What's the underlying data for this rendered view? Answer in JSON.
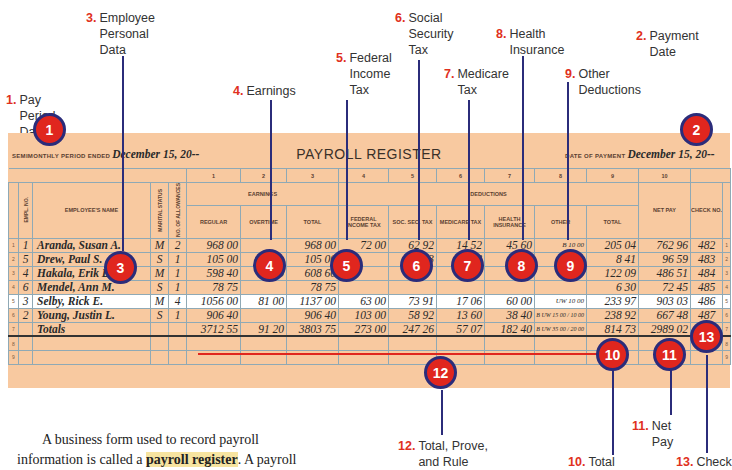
{
  "callouts": [
    {
      "num": "1.",
      "label": "Pay Period Date"
    },
    {
      "num": "2.",
      "label": "Payment Date"
    },
    {
      "num": "3.",
      "label": "Employee Personal Data"
    },
    {
      "num": "4.",
      "label": "Earnings"
    },
    {
      "num": "5.",
      "label": "Federal Income Tax"
    },
    {
      "num": "6.",
      "label": "Social Security Tax"
    },
    {
      "num": "7.",
      "label": "Medicare Tax"
    },
    {
      "num": "8.",
      "label": "Health Insurance"
    },
    {
      "num": "9.",
      "label": "Other Deductions"
    },
    {
      "num": "10.",
      "label": "Total"
    },
    {
      "num": "11.",
      "label": "Net Pay"
    },
    {
      "num": "12.",
      "label": "Total, Prove, and Rule"
    },
    {
      "num": "13.",
      "label": "Check"
    }
  ],
  "badges": [
    "1",
    "2",
    "3",
    "4",
    "5",
    "6",
    "7",
    "8",
    "9",
    "10",
    "11",
    "12",
    "13"
  ],
  "form": {
    "title": "PAYROLL REGISTER",
    "period_label": "SEMIMONTHLY PERIOD ENDED",
    "period_date": "December 15, 20--",
    "payment_label": "DATE OF PAYMENT",
    "payment_date": "December 15, 20--",
    "column_numbers": [
      "1",
      "2",
      "3",
      "4",
      "5",
      "6",
      "7",
      "8",
      "9",
      "10"
    ],
    "group_headers": {
      "earnings": "EARNINGS",
      "deductions": "DEDUCTIONS"
    },
    "headers": {
      "empl_no": "EMPL. NO.",
      "name": "EMPLOYEE'S NAME",
      "marital": "MARITAL STATUS",
      "allowances": "NO. OF ALLOWANCES",
      "regular": "REGULAR",
      "overtime": "OVERTIME",
      "total_earn": "TOTAL",
      "fit": "FEDERAL INCOME TAX",
      "ss": "SOC. SEC. TAX",
      "medicare": "MEDICARE TAX",
      "health": "HEALTH INSURANCE",
      "other": "OTHER",
      "total_ded": "TOTAL",
      "net_pay": "NET PAY",
      "check": "CHECK NO."
    },
    "rows": [
      {
        "line": "1",
        "empl": "1",
        "name": "Aranda, Susan A.",
        "marital": "M",
        "allow": "2",
        "regular": "968 00",
        "overtime": "",
        "total": "968 00",
        "fit": "72 00",
        "ss": "62 92",
        "med": "14 52",
        "health": "45 60",
        "other_code": "B",
        "other": "10 00",
        "total_ded": "205 04",
        "net": "762 96",
        "check": "482"
      },
      {
        "line": "2",
        "empl": "5",
        "name": "Drew, Paul S.",
        "marital": "S",
        "allow": "1",
        "regular": "105 00",
        "overtime": "",
        "total": "105 00",
        "fit": "",
        "ss": "6 83",
        "med": "1 58",
        "health": "",
        "other_code": "",
        "other": "",
        "total_ded": "8 41",
        "net": "96 59",
        "check": "483"
      },
      {
        "line": "3",
        "empl": "4",
        "name": "Hakala, Erik D.",
        "marital": "M",
        "allow": "1",
        "regular": "598 40",
        "overtime": "10 20",
        "total": "608 60",
        "fit": "",
        "ss": "",
        "med": "",
        "health": "",
        "other_code": "",
        "other": "",
        "total_ded": "122 09",
        "net": "486 51",
        "check": "484"
      },
      {
        "line": "4",
        "empl": "6",
        "name": "Mendel, Ann M.",
        "marital": "S",
        "allow": "1",
        "regular": "78 75",
        "overtime": "",
        "total": "78 75",
        "fit": "",
        "ss": "",
        "med": "",
        "health": "",
        "other_code": "",
        "other": "",
        "total_ded": "6 30",
        "net": "72 45",
        "check": "485"
      },
      {
        "line": "5",
        "empl": "3",
        "name": "Selby, Rick E.",
        "marital": "M",
        "allow": "4",
        "regular": "1056 00",
        "overtime": "81 00",
        "total": "1137 00",
        "fit": "63 00",
        "ss": "73 91",
        "med": "17 06",
        "health": "60 00",
        "other_code": "UW",
        "other": "10 00",
        "total_ded": "233 97",
        "net": "903 03",
        "check": "486"
      },
      {
        "line": "6",
        "empl": "2",
        "name": "Young, Justin L.",
        "marital": "S",
        "allow": "1",
        "regular": "906 40",
        "overtime": "",
        "total": "906 40",
        "fit": "103 00",
        "ss": "58 92",
        "med": "13 60",
        "health": "38 40",
        "other_code": "B UW",
        "other": "15 00 / 10 00",
        "total_ded": "238 92",
        "net": "667 48",
        "check": "487"
      }
    ],
    "totals": {
      "line": "7",
      "label": "Totals",
      "regular": "3712 55",
      "overtime": "91 20",
      "total": "3803 75",
      "fit": "273 00",
      "ss": "247 26",
      "med": "57 07",
      "health": "182 40",
      "other_code": "B UW",
      "other": "35 00 / 20 00",
      "total_ded": "814 73",
      "net": "2989 02"
    },
    "empty_lines": [
      "8",
      "9"
    ]
  },
  "body_text": {
    "before": "A business form used to record payroll",
    "line2_start": "information is called a ",
    "term": "payroll register",
    "line2_end": ". A payroll"
  }
}
